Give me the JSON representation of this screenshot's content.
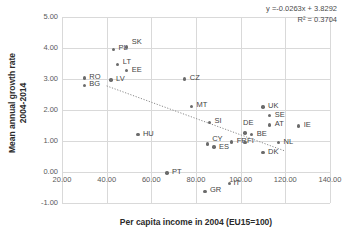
{
  "chart_data": {
    "type": "scatter",
    "title": "",
    "xlabel": "Per capita income in 2004 (EU15=100)",
    "ylabel": "Mean annual growth rate\n2004-2014",
    "xlim": [
      20,
      140
    ],
    "ylim": [
      -1.0,
      5.0
    ],
    "xticks": [
      "20.00",
      "40.00",
      "60.00",
      "80.00",
      "100.00",
      "120.00",
      "140.00"
    ],
    "xtick_values": [
      20,
      40,
      60,
      80,
      100,
      120,
      140
    ],
    "yticks": [
      "-1.00",
      "0.00",
      "1.00",
      "2.00",
      "3.00",
      "4.00",
      "5.00"
    ],
    "ytick_values": [
      -1,
      0,
      1,
      2,
      3,
      4,
      5
    ],
    "grid": true,
    "legend": null,
    "annotations": {
      "equation": "y =-0.0263x + 3.8292",
      "r_squared": "R² = 0.3704"
    },
    "trendline": {
      "slope": -0.0263,
      "intercept": 3.8292,
      "r2": 0.3704,
      "style": "dotted",
      "x_start": 40,
      "x_end": 120
    },
    "points": [
      {
        "label": "PL",
        "x": 43,
        "y": 3.95,
        "label_dx": 5,
        "label_dy": -4
      },
      {
        "label": "SK",
        "x": 49,
        "y": 4.03,
        "label_dx": 5,
        "label_dy": -7
      },
      {
        "label": "LT",
        "x": 45,
        "y": 3.47,
        "label_dx": 5,
        "label_dy": -4
      },
      {
        "label": "EE",
        "x": 49,
        "y": 3.28,
        "label_dx": 5,
        "label_dy": -2
      },
      {
        "label": "RO",
        "x": 30,
        "y": 3.03,
        "label_dx": 5,
        "label_dy": -3
      },
      {
        "label": "BG",
        "x": 30,
        "y": 2.8,
        "label_dx": 5,
        "label_dy": -3
      },
      {
        "label": "LV",
        "x": 42,
        "y": 2.97,
        "label_dx": 5,
        "label_dy": -3
      },
      {
        "label": "CZ",
        "x": 75,
        "y": 3.0,
        "label_dx": 5,
        "label_dy": -3
      },
      {
        "label": "MT",
        "x": 78,
        "y": 2.12,
        "label_dx": 5,
        "label_dy": -3
      },
      {
        "label": "SI",
        "x": 86,
        "y": 1.6,
        "label_dx": 5,
        "label_dy": -3
      },
      {
        "label": "HU",
        "x": 54,
        "y": 1.21,
        "label_dx": 5,
        "label_dy": -3
      },
      {
        "label": "UK",
        "x": 110,
        "y": 2.1,
        "label_dx": 5,
        "label_dy": -3
      },
      {
        "label": "SE",
        "x": 113,
        "y": 1.82,
        "label_dx": 5,
        "label_dy": -3
      },
      {
        "label": "AT",
        "x": 113,
        "y": 1.52,
        "label_dx": 5,
        "label_dy": -3
      },
      {
        "label": "IE",
        "x": 126,
        "y": 1.48,
        "label_dx": 5,
        "label_dy": -3
      },
      {
        "label": "DE",
        "x": 102,
        "y": 1.26,
        "label_dx": -2,
        "label_dy": -12
      },
      {
        "label": "BE",
        "x": 105,
        "y": 1.2,
        "label_dx": 5,
        "label_dy": -3
      },
      {
        "label": "CY",
        "x": 85,
        "y": 0.9,
        "label_dx": 5,
        "label_dy": -7
      },
      {
        "label": "ES",
        "x": 88,
        "y": 0.81,
        "label_dx": 5,
        "label_dy": -2
      },
      {
        "label": "FR",
        "x": 96,
        "y": 0.97,
        "label_dx": 5,
        "label_dy": -3
      },
      {
        "label": "FI",
        "x": 102,
        "y": 0.96,
        "label_dx": 2,
        "label_dy": 0
      },
      {
        "label": "NL",
        "x": 117,
        "y": 0.95,
        "label_dx": 5,
        "label_dy": -3
      },
      {
        "label": "DK",
        "x": 110,
        "y": 0.63,
        "label_dx": 5,
        "label_dy": -3
      },
      {
        "label": "PT",
        "x": 67,
        "y": -0.03,
        "label_dx": 5,
        "label_dy": -3
      },
      {
        "label": "IT",
        "x": 95,
        "y": -0.38,
        "label_dx": 4,
        "label_dy": 0
      },
      {
        "label": "GR",
        "x": 84,
        "y": -0.62,
        "label_dx": 5,
        "label_dy": -3
      }
    ]
  }
}
